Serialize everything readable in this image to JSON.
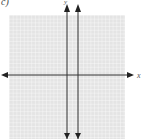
{
  "problem": {
    "label": "c)",
    "x_axis_label": "x",
    "y_axis_label": "y"
  },
  "graph": {
    "grid_range": {
      "x": [
        -16,
        16
      ],
      "y": [
        -16,
        16
      ]
    },
    "grid_color": "#cfcfcf",
    "grid_bg": "#e6e6e6",
    "axis_color": "#333333",
    "line": {
      "equation": "x = 3",
      "color": "#333333"
    }
  }
}
